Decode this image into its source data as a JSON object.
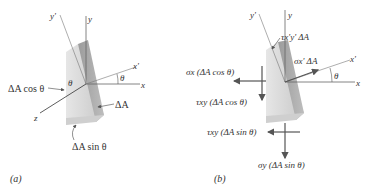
{
  "panel_a": {
    "caption": "(a)",
    "axes": {
      "y_prime": "y'",
      "y": "y",
      "x_prime": "x'",
      "x": "x",
      "z": "z"
    },
    "angle_label": "θ",
    "face_angle_label": "θ",
    "labels": {
      "area_cos": "ΔA cos θ",
      "area": "ΔA",
      "area_sin": "ΔA sin θ"
    }
  },
  "panel_b": {
    "caption": "(b)",
    "axes": {
      "y_prime": "y'",
      "y": "y",
      "x_prime": "x'",
      "x": "x"
    },
    "angle_label": "θ",
    "forces": {
      "tau_xy_prime": "τx'y' ΔA",
      "sigma_x_prime": "σx' ΔA",
      "sigma_x_cos": "σx (ΔA cos θ)",
      "tau_xy_cos": "τxy (ΔA cos θ)",
      "tau_xy_sin": "τxy (ΔA sin θ)",
      "sigma_y_sin": "σy (ΔA sin θ)"
    }
  },
  "colors": {
    "line": "#666666",
    "arrow": "#555555",
    "wedge_light": "#dcdcdc",
    "wedge_dark": "#9a9a9a"
  }
}
